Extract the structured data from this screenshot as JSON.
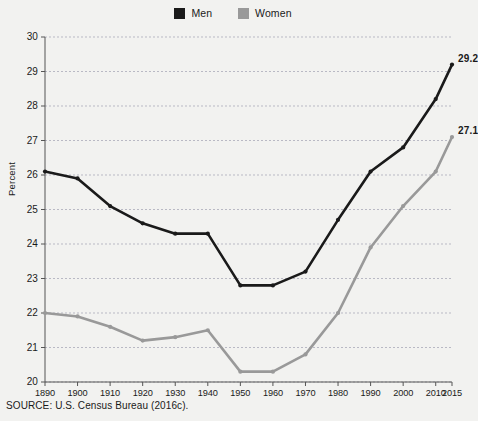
{
  "chart_data": {
    "type": "line",
    "title": "",
    "xlabel": "",
    "ylabel": "Percent",
    "ylim": [
      20,
      30
    ],
    "yticks": [
      20,
      21,
      22,
      23,
      24,
      25,
      26,
      27,
      28,
      29,
      30
    ],
    "grid": true,
    "legend_position": "top-center",
    "x": [
      1890,
      1900,
      1910,
      1920,
      1930,
      1940,
      1950,
      1960,
      1970,
      1980,
      1990,
      2000,
      2010,
      2015
    ],
    "xticklabels": [
      "1890",
      "1900",
      "1910",
      "1920",
      "1930",
      "1940",
      "1950",
      "1960",
      "1970",
      "1980",
      "1990",
      "2000",
      "2010",
      "2015"
    ],
    "series": [
      {
        "name": "Men",
        "color": "#1a1a1a",
        "values": [
          26.1,
          25.9,
          25.1,
          24.6,
          24.3,
          24.3,
          22.8,
          22.8,
          23.2,
          24.7,
          26.1,
          26.8,
          28.2,
          29.2
        ],
        "end_label": "29.2"
      },
      {
        "name": "Women",
        "color": "#999999",
        "values": [
          22.0,
          21.9,
          21.6,
          21.2,
          21.3,
          21.5,
          20.3,
          20.3,
          20.8,
          22.0,
          23.9,
          25.1,
          26.1,
          27.1
        ],
        "end_label": "27.1"
      }
    ]
  },
  "legend": {
    "entries": [
      {
        "label": "Men",
        "color": "#1a1a1a"
      },
      {
        "label": "Women",
        "color": "#999999"
      }
    ]
  },
  "axes": {
    "y_title": "Percent"
  },
  "footer": {
    "source": "SOURCE: U.S. Census Bureau (2016c)."
  }
}
